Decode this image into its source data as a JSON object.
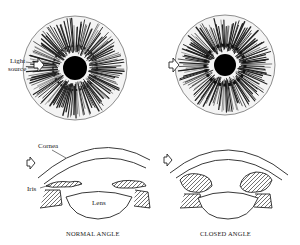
{
  "labels": {
    "light_source_line1": "Light",
    "light_source_line2": "source",
    "cornea": "Cornea",
    "iris": "Iris",
    "lens": "Lens",
    "normal_caption": "NORMAL ANGLE",
    "closed_caption": "CLOSED ANGLE"
  },
  "figures": [
    {
      "id": "normal-iris-front",
      "cx": 75,
      "cy": 68,
      "r": 52,
      "pupil_r": 12
    },
    {
      "id": "closed-iris-front",
      "cx": 225,
      "cy": 65,
      "r": 50,
      "pupil_r": 11
    }
  ],
  "colors": {
    "ink": "#1a1a1a",
    "background": "#ffffff"
  }
}
